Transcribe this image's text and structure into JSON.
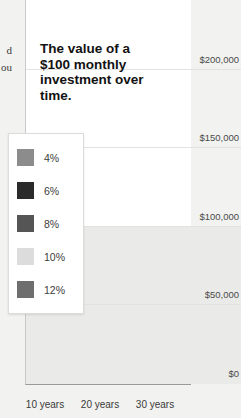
{
  "left_column": {
    "fragments": [
      "d",
      "ou"
    ]
  },
  "chart_title": "The value of a $100 monthly investment over time.",
  "legend": {
    "items": [
      {
        "label": "4%",
        "color": "#8c8c8c"
      },
      {
        "label": "6%",
        "color": "#2b2b2b"
      },
      {
        "label": "8%",
        "color": "#555555"
      },
      {
        "label": "10%",
        "color": "#dcdcdc"
      },
      {
        "label": "12%",
        "color": "#6e6e6e"
      }
    ]
  },
  "chart_data": {
    "type": "bar",
    "title": "The value of a $100 monthly investment over time.",
    "xlabel": "",
    "ylabel": "",
    "categories": [
      "10 years",
      "20 years",
      "30 years"
    ],
    "series": [
      {
        "name": "4%",
        "color": "#8c8c8c",
        "values": [
          14500,
          36500,
          69500
        ]
      },
      {
        "name": "6%",
        "color": "#2b2b2b",
        "values": [
          16400,
          46000,
          100000
        ]
      },
      {
        "name": "8%",
        "color": "#555555",
        "values": [
          18200,
          58500,
          149000
        ]
      },
      {
        "name": "10%",
        "color": "#dcdcdc",
        "values": [
          20400,
          75500,
          227000
        ]
      },
      {
        "name": "12%",
        "color": "#6e6e6e",
        "values": [
          23000,
          98500,
          349000
        ]
      }
    ],
    "ylim": [
      0,
      270000
    ],
    "yticks": [
      0,
      50000,
      100000,
      150000,
      200000,
      250000
    ],
    "ytick_labels": [
      "$0",
      "$50,000",
      "$100,000",
      "$150,000",
      "$200,000",
      "$250,000"
    ],
    "grid": true,
    "legend_position": "overlay-left",
    "shaded_band": {
      "from": 0,
      "to": 100000,
      "color": "#eaeae8"
    },
    "note": "The 12% / 30 years bar is clipped by the top edge of the image."
  },
  "colors": {
    "page_background": "#f2f2f0",
    "plot_background": "#ffffff",
    "axis": "#9a9a98",
    "gridline": "#e2e2e0",
    "text": "#3a3a3a"
  }
}
